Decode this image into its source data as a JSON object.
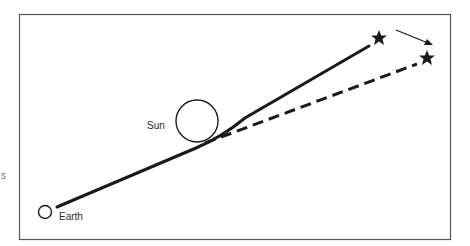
{
  "diagram": {
    "labels": {
      "sun": "Sun",
      "earth": "Earth",
      "margin_fragment": "s"
    },
    "objects": [
      {
        "name": "Earth",
        "shape": "circle",
        "cx": 45,
        "cy": 212,
        "r": 7
      },
      {
        "name": "Sun",
        "shape": "circle",
        "cx": 197,
        "cy": 121,
        "r": 21
      },
      {
        "name": "Star (actual position)",
        "shape": "star",
        "cx": 379,
        "cy": 38
      },
      {
        "name": "Star (apparent position)",
        "shape": "star",
        "cx": 427,
        "cy": 58
      }
    ],
    "paths": [
      {
        "name": "actual light path (bent)",
        "style": "solid"
      },
      {
        "name": "apparent line of sight",
        "style": "dashed"
      },
      {
        "name": "apparent shift arrow",
        "style": "arrow"
      }
    ],
    "colors": {
      "ink": "#1a1a1a",
      "frame": "#555555",
      "background": "#ffffff"
    }
  }
}
